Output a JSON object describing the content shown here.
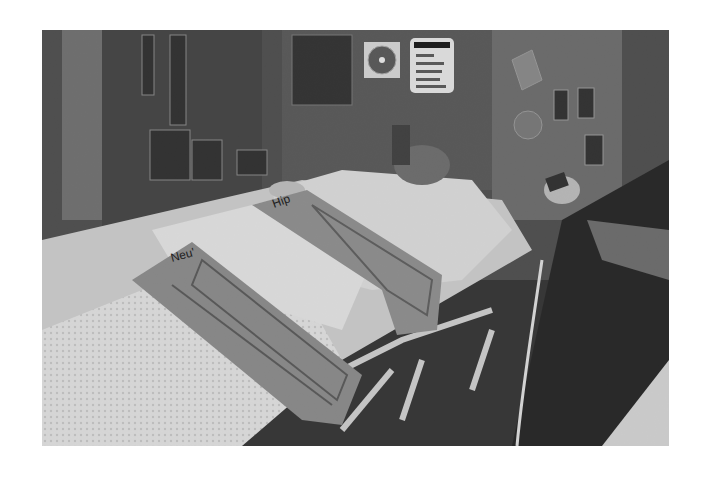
{
  "image": {
    "alt": "Grayscale photograph of a patient lying on a hospital stretcher in an emergency room, strapped down with two padded restraint belts over white blankets, with wall-mounted medical equipment, a wall clock and a posted notice in the background, and a person's arm holding a device on the right.",
    "straps": [
      {
        "label": "Neu'"
      },
      {
        "label": "Hip"
      }
    ],
    "wall_sign": {
      "lines": [
        "Do not",
        "Please",
        "do not put",
        "the reset",
        "your KNOBS!"
      ]
    }
  }
}
